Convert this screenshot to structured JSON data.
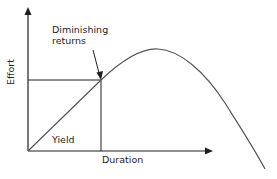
{
  "diagram": {
    "axes": {
      "x_label": "Duration",
      "y_label": "Effort"
    },
    "annotations": {
      "diminishing_returns_line1": "Diminishing",
      "diminishing_returns_line2": "returns",
      "yield": "Yield"
    },
    "colors": {
      "axis": "#1e1e1e",
      "curve": "#555555",
      "background": "#ffffff"
    }
  }
}
